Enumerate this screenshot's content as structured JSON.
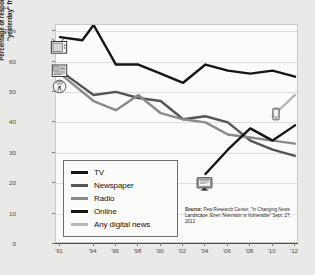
{
  "chart_data": {
    "type": "line",
    "title": "",
    "xlabel": "",
    "ylabel": "Percentage of respondents who got their news \"yesterday\" from these platforms",
    "ylim": [
      0,
      72
    ],
    "xlim": [
      1991,
      2012
    ],
    "yticks": [
      "0",
      "10",
      "20",
      "30",
      "40",
      "50",
      "60",
      "70%"
    ],
    "ytick_values": [
      0,
      10,
      20,
      30,
      40,
      50,
      60,
      70
    ],
    "xticks": [
      "'91",
      "'94",
      "'96",
      "'98",
      "'00",
      "'02",
      "'04",
      "'06",
      "'08",
      "'10",
      "'12"
    ],
    "xtick_values": [
      1991,
      1994,
      1996,
      1998,
      2000,
      2002,
      2004,
      2006,
      2008,
      2010,
      2012
    ],
    "grid": true,
    "legend_position": "lower-left",
    "series": [
      {
        "name": "TV",
        "color": "#151515",
        "x": [
          1991,
          1993,
          1994,
          1996,
          1998,
          2000,
          2002,
          2004,
          2006,
          2008,
          2010,
          2012
        ],
        "values": [
          68,
          67,
          72,
          59,
          59,
          56,
          53,
          59,
          57,
          56,
          57,
          55
        ]
      },
      {
        "name": "Newspaper",
        "color": "#555555",
        "x": [
          1991,
          1994,
          1996,
          1998,
          2000,
          2002,
          2004,
          2006,
          2008,
          2010,
          2012
        ],
        "values": [
          57,
          49,
          50,
          48,
          47,
          41,
          42,
          40,
          34,
          31,
          29
        ]
      },
      {
        "name": "Radio",
        "color": "#8a8a8a",
        "x": [
          1991,
          1994,
          1996,
          1998,
          2000,
          2002,
          2004,
          2006,
          2008,
          2010,
          2012
        ],
        "values": [
          56,
          47,
          44,
          49,
          43,
          41,
          40,
          36,
          35,
          34,
          33
        ]
      },
      {
        "name": "Online",
        "color": "#151515",
        "x": [
          2004,
          2006,
          2008,
          2010,
          2012
        ],
        "values": [
          23,
          31,
          38,
          34,
          39
        ]
      },
      {
        "name": "Any digital news",
        "color": "#b6b6b6",
        "x": [
          2010,
          2012
        ],
        "values": [
          42,
          49
        ]
      }
    ],
    "annotations": [
      {
        "icon": "television-icon",
        "series": "TV",
        "x": 1991,
        "y": 67
      },
      {
        "icon": "newspaper-icon",
        "series": "Newspaper",
        "x": 1991,
        "y": 57
      },
      {
        "icon": "radio-tower-icon",
        "series": "Radio",
        "x": 1991,
        "y": 53
      },
      {
        "icon": "desktop-computer-icon",
        "series": "Online",
        "x": 2004,
        "y": 22
      },
      {
        "icon": "mobile-phone-icon",
        "series": "Any digital news",
        "x": 2010,
        "y": 42
      }
    ]
  },
  "legend": {
    "items": [
      {
        "label": "TV",
        "color": "#151515"
      },
      {
        "label": "Newspaper",
        "color": "#555555"
      },
      {
        "label": "Radio",
        "color": "#8a8a8a"
      },
      {
        "label": "Online",
        "color": "#151515"
      },
      {
        "label": "Any digital news",
        "color": "#b6b6b6"
      }
    ]
  },
  "source": {
    "prefix": "Source:",
    "text": " Pew Research Center, \"In Changing News Landscape, Even Television is Vulnerable\" Sept. 27, 2012"
  }
}
